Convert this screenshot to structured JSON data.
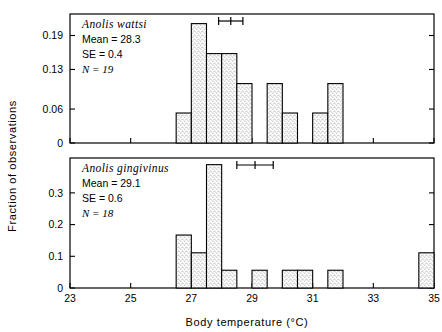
{
  "figure": {
    "y_axis_title": "Fraction of observations",
    "x_axis_title": "Body temperature (°C)"
  },
  "chart_data": [
    {
      "type": "bar",
      "panel": "top",
      "title": "Anolis wattsi",
      "annotations": {
        "species": "Anolis wattsi",
        "mean_label": "Mean = 28.3",
        "se_label": "SE = 0.4",
        "n_label": "N = 19",
        "mean": 28.3,
        "se": 0.4,
        "n": 19
      },
      "xlabel": "Body temperature (°C)",
      "ylabel": "Fraction of observations",
      "xlim": [
        23,
        35
      ],
      "ylim": [
        0,
        0.228
      ],
      "xticks": [
        23,
        25,
        27,
        29,
        31,
        33,
        35
      ],
      "xticklabels": [
        "23",
        "25",
        "27",
        "29",
        "31",
        "33",
        "35"
      ],
      "yticks": [
        0,
        0.06,
        0.13,
        0.19
      ],
      "yticklabels": [
        "0",
        "0.06",
        "0.13",
        "0.19"
      ],
      "grid": false,
      "legend": "none",
      "bin_width": 0.5,
      "bins": [
        26.5,
        27.0,
        27.5,
        28.0,
        28.5,
        29.5,
        30.0,
        31.0,
        31.5
      ],
      "values": [
        0.053,
        0.211,
        0.158,
        0.158,
        0.105,
        0.105,
        0.053,
        0.053,
        0.105
      ],
      "error_bar": {
        "center": 28.3,
        "low": 27.9,
        "high": 28.7
      }
    },
    {
      "type": "bar",
      "panel": "bottom",
      "title": "Anolis gingivinus",
      "annotations": {
        "species": "Anolis gingivinus",
        "mean_label": "Mean = 29.1",
        "se_label": "SE = 0.6",
        "n_label": "N = 18",
        "mean": 29.1,
        "se": 0.6,
        "n": 18
      },
      "xlabel": "Body temperature (°C)",
      "ylabel": "Fraction of observations",
      "xlim": [
        23,
        35
      ],
      "ylim": [
        0,
        0.41
      ],
      "xticks": [
        23,
        25,
        27,
        29,
        31,
        33,
        35
      ],
      "xticklabels": [
        "23",
        "25",
        "27",
        "29",
        "31",
        "33",
        "35"
      ],
      "yticks": [
        0,
        0.1,
        0.2,
        0.3
      ],
      "yticklabels": [
        "0",
        "0.1",
        "0.2",
        "0.3"
      ],
      "grid": false,
      "legend": "none",
      "bin_width": 0.5,
      "bins": [
        26.5,
        27.0,
        27.5,
        28.0,
        29.0,
        30.0,
        30.5,
        31.5,
        34.5
      ],
      "values": [
        0.167,
        0.111,
        0.389,
        0.056,
        0.056,
        0.056,
        0.056,
        0.056,
        0.111
      ],
      "error_bar": {
        "center": 29.1,
        "low": 28.5,
        "high": 29.7
      }
    }
  ]
}
